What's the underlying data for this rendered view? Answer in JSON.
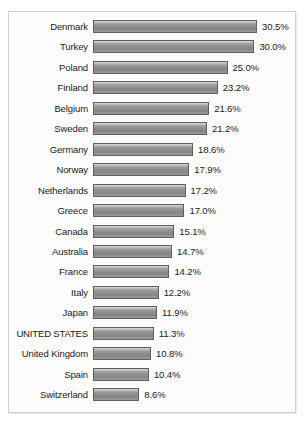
{
  "chart_data": {
    "type": "bar",
    "orientation": "horizontal",
    "title": "",
    "subtitle": "",
    "xlabel": "",
    "ylabel": "",
    "grid": false,
    "legend": null,
    "value_suffix": "%",
    "xlim": [
      0,
      30.5
    ],
    "categories": [
      "Denmark",
      "Turkey",
      "Poland",
      "Finland",
      "Belgium",
      "Sweden",
      "Germany",
      "Norway",
      "Netherlands",
      "Greece",
      "Canada",
      "Australia",
      "France",
      "Italy",
      "Japan",
      "UNITED STATES",
      "United Kingdom",
      "Spain",
      "Switzerland"
    ],
    "values": [
      30.5,
      30.0,
      25.0,
      23.2,
      21.6,
      21.2,
      18.6,
      17.9,
      17.2,
      17.0,
      15.1,
      14.7,
      14.2,
      12.2,
      11.9,
      11.3,
      10.8,
      10.4,
      8.6
    ],
    "value_labels": [
      "30.5%",
      "30.0%",
      "25.0%",
      "23.2%",
      "21.6%",
      "21.2%",
      "18.6%",
      "17.9%",
      "17.2%",
      "17.0%",
      "15.1%",
      "14.7%",
      "14.2%",
      "12.2%",
      "11.9%",
      "11.3%",
      "10.8%",
      "10.4%",
      "8.6%"
    ],
    "emphasized_category": "UNITED STATES",
    "colors": {
      "bar_top": "#dcdcdc",
      "bar_mid": "#8c8c8c",
      "bar_bottom": "#8a8a8a",
      "bar_border": "#5f5f5f",
      "text": "#1a1a1a",
      "frame_border": "#d0d0d0",
      "background": "#fdfdfd"
    }
  },
  "layout": {
    "px_per_unit": 5.38,
    "bar_start_x": 84,
    "row_pitch": 20.45,
    "first_row_top": 8
  }
}
